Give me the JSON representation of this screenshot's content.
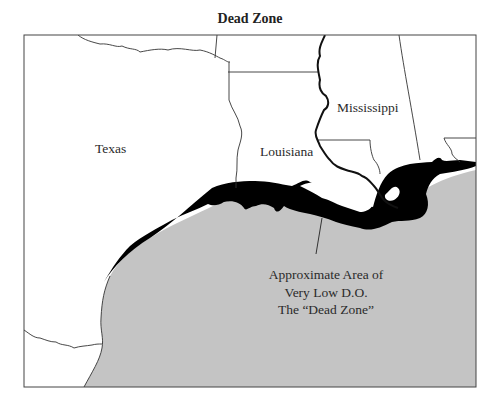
{
  "title": "Dead Zone",
  "colors": {
    "land": "#ffffff",
    "gulf": "#c4c4c4",
    "dead_zone": "#000000",
    "border": "#333333"
  },
  "states": {
    "texas": "Texas",
    "louisiana": "Louisiana",
    "mississippi": "Mississippi"
  },
  "annotation": {
    "lines": [
      "Approximate Area of",
      "Very Low D.O.",
      "The “Dead Zone”"
    ]
  }
}
